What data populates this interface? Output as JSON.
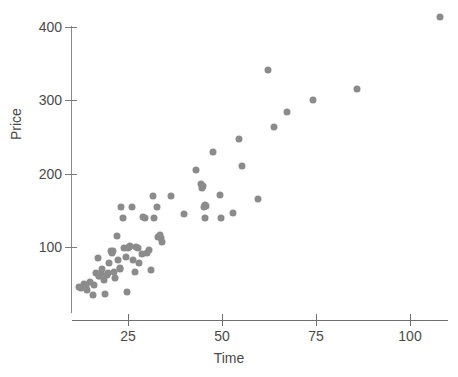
{
  "chart_data": {
    "type": "scatter",
    "title": "",
    "xlabel": "Time",
    "ylabel": "Price",
    "xlim": [
      10,
      112
    ],
    "ylim": [
      25,
      420
    ],
    "xticks": [
      25,
      50,
      75,
      100
    ],
    "yticks": [
      100,
      200,
      300,
      400
    ],
    "xtick_labels": [
      "25",
      "50",
      "75",
      "100"
    ],
    "ytick_labels": [
      "100",
      "200",
      "300",
      "400"
    ],
    "grid": false,
    "legend": null,
    "marker_color": "#8b8b8b",
    "marker_size": 7,
    "axis_color": "#6f6f6f",
    "text_color": "#4a4a4a",
    "background_color": "#ffffff",
    "n_points": 78,
    "points": [
      [
        12.0,
        46.0
      ],
      [
        12.6,
        44.0
      ],
      [
        13.2,
        49.0
      ],
      [
        14.0,
        42.0
      ],
      [
        15.0,
        52.0
      ],
      [
        15.6,
        35.0
      ],
      [
        16.5,
        64.0
      ],
      [
        17.0,
        85.0
      ],
      [
        17.4,
        60.0
      ],
      [
        18.0,
        70.0
      ],
      [
        18.6,
        55.0
      ],
      [
        19.0,
        36.0
      ],
      [
        19.4,
        62.0
      ],
      [
        20.0,
        78.0
      ],
      [
        20.4,
        95.0
      ],
      [
        20.8,
        92.0
      ],
      [
        21.2,
        66.0
      ],
      [
        21.6,
        58.0
      ],
      [
        22.0,
        115.0
      ],
      [
        22.4,
        82.0
      ],
      [
        22.8,
        70.0
      ],
      [
        23.2,
        155.0
      ],
      [
        23.6,
        140.0
      ],
      [
        24.0,
        98.0
      ],
      [
        24.4,
        86.0
      ],
      [
        24.8,
        38.0
      ],
      [
        25.2,
        100.0
      ],
      [
        25.6,
        101.0
      ],
      [
        26.0,
        155.0
      ],
      [
        26.4,
        82.0
      ],
      [
        26.8,
        66.0
      ],
      [
        27.2,
        100.0
      ],
      [
        27.6,
        99.0
      ],
      [
        28.0,
        78.0
      ],
      [
        28.8,
        90.0
      ],
      [
        29.4,
        140.0
      ],
      [
        30.0,
        92.0
      ],
      [
        30.6,
        96.0
      ],
      [
        31.0,
        68.0
      ],
      [
        31.6,
        170.0
      ],
      [
        32.0,
        140.0
      ],
      [
        32.6,
        155.0
      ],
      [
        33.0,
        113.0
      ],
      [
        33.4,
        117.0
      ],
      [
        34.0,
        107.0
      ],
      [
        36.4,
        170.0
      ],
      [
        40.0,
        145.0
      ],
      [
        43.0,
        205.0
      ],
      [
        44.4,
        186.0
      ],
      [
        44.8,
        181.0
      ],
      [
        45.2,
        155.0
      ],
      [
        45.8,
        156.0
      ],
      [
        45.4,
        140.0
      ],
      [
        47.6,
        229.0
      ],
      [
        49.4,
        171.0
      ],
      [
        49.8,
        140.0
      ],
      [
        52.8,
        146.0
      ],
      [
        54.4,
        247.0
      ],
      [
        55.4,
        211.0
      ],
      [
        59.6,
        165.0
      ],
      [
        62.2,
        341.0
      ],
      [
        63.8,
        263.0
      ],
      [
        67.2,
        284.0
      ],
      [
        74.2,
        300.0
      ],
      [
        86.0,
        316.0
      ],
      [
        108.0,
        413.0
      ],
      [
        13.8,
        47.0
      ],
      [
        16.0,
        48.0
      ],
      [
        17.8,
        63.0
      ],
      [
        19.8,
        64.0
      ],
      [
        21.0,
        94.0
      ],
      [
        23.0,
        72.0
      ],
      [
        25.0,
        99.0
      ],
      [
        29.0,
        141.0
      ],
      [
        33.8,
        112.0
      ],
      [
        45.0,
        183.0
      ],
      [
        45.6,
        157.0
      ],
      [
        17.2,
        61.0
      ]
    ]
  },
  "axis_titles": {
    "x": "Time",
    "y": "Price"
  }
}
